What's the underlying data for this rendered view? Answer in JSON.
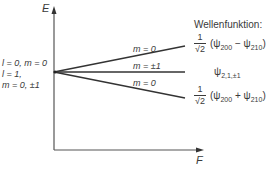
{
  "diagram": {
    "type": "energy-level-splitting",
    "axes": {
      "y_label": "E",
      "x_label": "F"
    },
    "left_labels": {
      "line1": "l = 0, m = 0",
      "line2": "l = 1,",
      "line3": "m = 0, ±1"
    },
    "lines": [
      {
        "label": "m = 0",
        "direction": "up"
      },
      {
        "label": "m = ±1",
        "direction": "flat"
      },
      {
        "label": "m = 0",
        "direction": "down"
      }
    ],
    "wavefunction_title": "Wellenfunktion:",
    "wavefunctions": [
      {
        "prefix_num": "1",
        "prefix_den": "√2",
        "expr_open": "(ψ",
        "sub1": "200",
        "op": " − ψ",
        "sub2": "210",
        "expr_close": ")"
      },
      {
        "symbol": "ψ",
        "sub": "2,1,±1"
      },
      {
        "prefix_num": "1",
        "prefix_den": "√2",
        "expr_open": "(ψ",
        "sub1": "200",
        "op": " + ψ",
        "sub2": "210",
        "expr_close": ")"
      }
    ],
    "colors": {
      "ink": "#3a3a3a",
      "background": "#ffffff"
    }
  }
}
